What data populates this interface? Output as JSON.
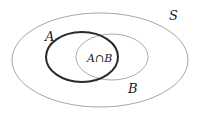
{
  "diagram": {
    "type": "venn",
    "universe": {
      "label": "S",
      "cx": 100,
      "cy": 60,
      "rx": 88,
      "ry": 47,
      "stroke": "#9a9a9a",
      "stroke_width": 0.9
    },
    "sets": [
      {
        "label": "A",
        "cx": 82,
        "cy": 57,
        "rx": 36,
        "ry": 25,
        "stroke": "#2a2a2a",
        "stroke_width": 2
      },
      {
        "label": "B",
        "cx": 112,
        "cy": 57,
        "rx": 36,
        "ry": 23,
        "stroke": "#a0a0a0",
        "stroke_width": 0.9
      }
    ],
    "labels": {
      "S": "S",
      "A": "A",
      "B": "B",
      "intersection": "A∩B"
    },
    "intersection": {
      "cx": 97,
      "cy": 57,
      "rx": 21,
      "ry": 20,
      "stroke": "#2a2a2a",
      "stroke_width": 2
    }
  }
}
